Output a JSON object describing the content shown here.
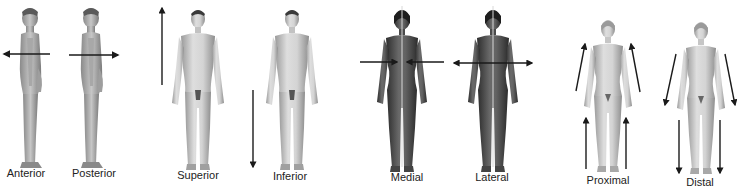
{
  "diagram": {
    "colors": {
      "background": "#ffffff",
      "arrow": "#1a1a1a",
      "light_figure": "#c8c8c8",
      "light_figure_shade": "#9a9a9a",
      "dark_figure": "#5a5a5a",
      "dark_figure_shade": "#3a3a3a",
      "midline": "#d8d8d8",
      "label_text": "#222222"
    },
    "panels": [
      {
        "id": "anterior",
        "label": "Anterior",
        "label_x": 26,
        "label_y": 174,
        "figure": "side-view-male",
        "arrow_icon": "arrow-left-icon",
        "direction": "toward front"
      },
      {
        "id": "posterior",
        "label": "Posterior",
        "label_x": 94,
        "label_y": 174,
        "figure": "side-view-male",
        "arrow_icon": "arrow-right-icon",
        "direction": "toward back"
      },
      {
        "id": "superior",
        "label": "Superior",
        "label_x": 198,
        "label_y": 176,
        "figure": "front-view-male",
        "arrow_icon": "arrow-up-icon",
        "direction": "toward head"
      },
      {
        "id": "inferior",
        "label": "Inferior",
        "label_x": 290,
        "label_y": 177,
        "figure": "front-view-male",
        "arrow_icon": "arrow-down-icon",
        "direction": "toward feet"
      },
      {
        "id": "medial",
        "label": "Medial",
        "label_x": 407,
        "label_y": 178,
        "figure": "front-view-female-dark",
        "arrow_icon": "arrows-inward-icon",
        "direction": "toward midline"
      },
      {
        "id": "lateral",
        "label": "Lateral",
        "label_x": 492,
        "label_y": 178,
        "figure": "front-view-female-dark",
        "arrow_icon": "arrows-outward-icon",
        "direction": "away from midline"
      },
      {
        "id": "proximal",
        "label": "Proximal",
        "label_x": 608,
        "label_y": 181,
        "figure": "front-view-female",
        "arrow_icon": "arrows-up-limbs-icon",
        "direction": "toward trunk"
      },
      {
        "id": "distal",
        "label": "Distal",
        "label_x": 700,
        "label_y": 183,
        "figure": "front-view-female",
        "arrow_icon": "arrows-down-limbs-icon",
        "direction": "away from trunk"
      }
    ]
  }
}
